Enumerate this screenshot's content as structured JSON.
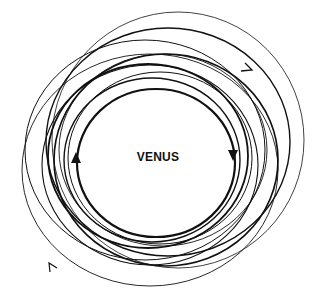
{
  "diagram": {
    "center_label": "VENUS",
    "line_color": "#111111",
    "background": "#ffffff",
    "orbit_count": 11,
    "arrows": [
      {
        "name": "inner-left-arrow",
        "direction": "up"
      },
      {
        "name": "inner-right-arrow",
        "direction": "down"
      },
      {
        "name": "outer-top-right-arrow",
        "direction": "right"
      },
      {
        "name": "outer-bottom-left-arrow",
        "direction": "up-left"
      }
    ]
  }
}
